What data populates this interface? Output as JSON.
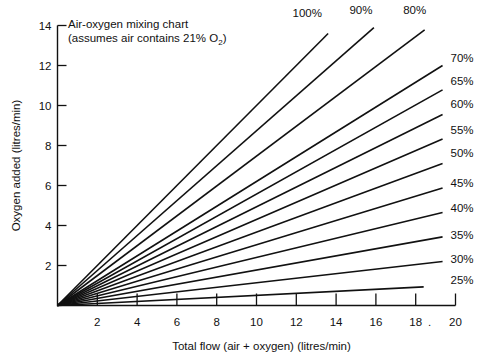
{
  "chart_data": {
    "type": "line",
    "title": "Air-oxygen mixing chart",
    "subtitle": "(assumes air contains 21% O₂)",
    "xlabel": "Total flow (air + oxygen) (litres/min)",
    "ylabel": "Oxygen added (litres/min)",
    "xlim": [
      0,
      20
    ],
    "ylim": [
      0,
      14
    ],
    "grid": false,
    "legend_position": "inline-line-end-labels",
    "xticks": [
      2,
      4,
      6,
      8,
      10,
      12,
      14,
      16,
      18,
      20
    ],
    "xtick_labels": [
      "2",
      "4",
      "6",
      "8",
      "10",
      "12",
      "14",
      "16",
      "18",
      "20"
    ],
    "yticks": [
      2,
      4,
      6,
      8,
      10,
      12,
      14
    ],
    "ytick_labels": [
      "2",
      "4",
      "6",
      "8",
      "10",
      "12",
      "14"
    ],
    "note": "Each line is oxygen added = total flow x (FiO2 - 0.21) / 0.79, all radiating from the origin.",
    "series": [
      {
        "name": "100%",
        "label": "100%",
        "fio2": 100,
        "slope": 1.0,
        "x": [
          0,
          13.6
        ],
        "y": [
          0,
          13.6
        ],
        "label_pos": "top",
        "label_x": 12.55,
        "label_y": 14.45
      },
      {
        "name": "90%",
        "label": "90%",
        "fio2": 90,
        "slope": 0.8734,
        "x": [
          0,
          15.9
        ],
        "y": [
          0,
          13.89
        ],
        "label_pos": "top",
        "label_x": 15.25,
        "label_y": 14.6
      },
      {
        "name": "80%",
        "label": "80%",
        "fio2": 80,
        "slope": 0.7468,
        "x": [
          0,
          18.45
        ],
        "y": [
          0,
          13.78
        ],
        "label_pos": "top",
        "label_x": 17.95,
        "label_y": 14.6
      },
      {
        "name": "70%",
        "label": "70%",
        "fio2": 70,
        "slope": 0.6203,
        "x": [
          0,
          19.35
        ],
        "y": [
          0,
          12.0
        ],
        "label_pos": "right",
        "label_x": 19.75,
        "label_y": 12.2
      },
      {
        "name": "65%",
        "label": "65%",
        "fio2": 65,
        "slope": 0.557,
        "x": [
          0,
          19.35
        ],
        "y": [
          0,
          10.78
        ],
        "label_pos": "right",
        "label_x": 19.75,
        "label_y": 11.05
      },
      {
        "name": "60%",
        "label": "60%",
        "fio2": 60,
        "slope": 0.4937,
        "x": [
          0,
          19.35
        ],
        "y": [
          0,
          9.55
        ],
        "label_pos": "right",
        "label_x": 19.75,
        "label_y": 9.9
      },
      {
        "name": "55%",
        "label": "55%",
        "fio2": 55,
        "slope": 0.4304,
        "x": [
          0,
          19.35
        ],
        "y": [
          0,
          8.33
        ],
        "label_pos": "right",
        "label_x": 19.75,
        "label_y": 8.6
      },
      {
        "name": "50%",
        "label": "50%",
        "fio2": 50,
        "slope": 0.3671,
        "x": [
          0,
          19.35
        ],
        "y": [
          0,
          7.1
        ],
        "label_pos": "right",
        "label_x": 19.75,
        "label_y": 7.45
      },
      {
        "name": "45%",
        "label": "45%",
        "fio2": 45,
        "slope": 0.3038,
        "x": [
          0,
          19.35
        ],
        "y": [
          0,
          5.88
        ],
        "label_pos": "right",
        "label_x": 19.75,
        "label_y": 5.95
      },
      {
        "name": "40%",
        "label": "40%",
        "fio2": 40,
        "slope": 0.2405,
        "x": [
          0,
          19.35
        ],
        "y": [
          0,
          4.65
        ],
        "label_pos": "right",
        "label_x": 19.75,
        "label_y": 4.7
      },
      {
        "name": "35%",
        "label": "35%",
        "fio2": 35,
        "slope": 0.1772,
        "x": [
          0,
          19.35
        ],
        "y": [
          0,
          3.43
        ],
        "label_pos": "right",
        "label_x": 19.75,
        "label_y": 3.35
      },
      {
        "name": "30%",
        "label": "30%",
        "fio2": 30,
        "slope": 0.1139,
        "x": [
          0,
          19.35
        ],
        "y": [
          0,
          2.2
        ],
        "label_pos": "right",
        "label_x": 19.75,
        "label_y": 2.15
      },
      {
        "name": "25%",
        "label": "25%",
        "fio2": 25,
        "slope": 0.0506,
        "x": [
          0,
          18.4
        ],
        "y": [
          0,
          0.93
        ],
        "label_pos": "right",
        "label_x": 19.75,
        "label_y": 1.1
      }
    ]
  },
  "colors": {
    "line": "#111111",
    "axis": "#111111",
    "background": "#ffffff"
  }
}
